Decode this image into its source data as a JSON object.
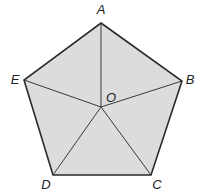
{
  "diagram": {
    "fill_color": "#dcdcdc",
    "stroke_color": "#2a2a2a",
    "vertices": {
      "A": {
        "label": "A",
        "x": 101,
        "y": 23,
        "lx": 101,
        "ly": 14
      },
      "B": {
        "label": "B",
        "x": 182,
        "y": 81,
        "lx": 190,
        "ly": 84
      },
      "C": {
        "label": "C",
        "x": 151,
        "y": 175,
        "lx": 157,
        "ly": 189
      },
      "D": {
        "label": "D",
        "x": 53,
        "y": 175,
        "lx": 46,
        "ly": 189
      },
      "E": {
        "label": "E",
        "x": 24,
        "y": 80,
        "lx": 15,
        "ly": 84
      }
    },
    "center": {
      "label": "O",
      "x": 101,
      "y": 107,
      "lx": 111,
      "ly": 102
    },
    "segments": [
      "AB",
      "BC",
      "CD",
      "DE",
      "EA",
      "OA",
      "OB",
      "OC",
      "OD",
      "OE"
    ]
  }
}
